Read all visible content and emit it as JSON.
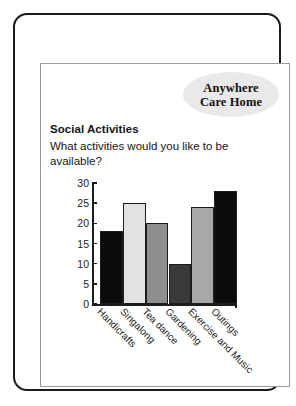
{
  "poster": {
    "logo": {
      "line1": "Anywhere",
      "line2": "Care Home",
      "bg_color": "#e9e9e9"
    },
    "title": "Social Activities",
    "question": "What activities would you like to be available?"
  },
  "chart_data": {
    "type": "bar",
    "title": "Social Activities",
    "subtitle": "What activities would you like to be available?",
    "categories": [
      "Handicrafts",
      "Singalong",
      "Tea dance",
      "Gardening",
      "Exercise and Music",
      "Outings"
    ],
    "values": [
      18,
      25,
      20,
      10,
      24,
      28
    ],
    "bar_colors": [
      "#0b0b0b",
      "#e2e2e2",
      "#8e8e8e",
      "#3a3a3a",
      "#a8a8a8",
      "#0b0b0b"
    ],
    "xlabel": "",
    "ylabel": "",
    "ylim": [
      0,
      30
    ],
    "yticks": [
      0,
      5,
      10,
      15,
      20,
      25,
      30
    ],
    "ytick_labels": [
      "0",
      "5",
      "10",
      "15",
      "20",
      "25",
      "30"
    ],
    "grid": false,
    "legend": false,
    "tick_label_rotation": 45
  }
}
